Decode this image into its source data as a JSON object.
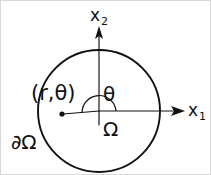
{
  "figure": {
    "background_color": "#ffffff",
    "ink_color": "#111111",
    "border_color": "#d8d8d8",
    "width": 211,
    "height": 175
  },
  "axes": {
    "vertical": {
      "label": "x",
      "subscript": "2",
      "arrow_direction": "up"
    },
    "horizontal": {
      "label": "x",
      "subscript": "1",
      "arrow_direction": "right"
    }
  },
  "labels": {
    "point": "(r,θ)",
    "angle": "θ",
    "domain": "Ω",
    "boundary": "∂Ω"
  },
  "geometry": {
    "circle": {
      "cx": 98,
      "cy": 110,
      "r": 61
    },
    "origin": {
      "x": 98,
      "y": 110
    },
    "point_marker": {
      "x": 61,
      "y": 113
    },
    "angle_arc_radius": 17,
    "angle_degrees": 175
  }
}
